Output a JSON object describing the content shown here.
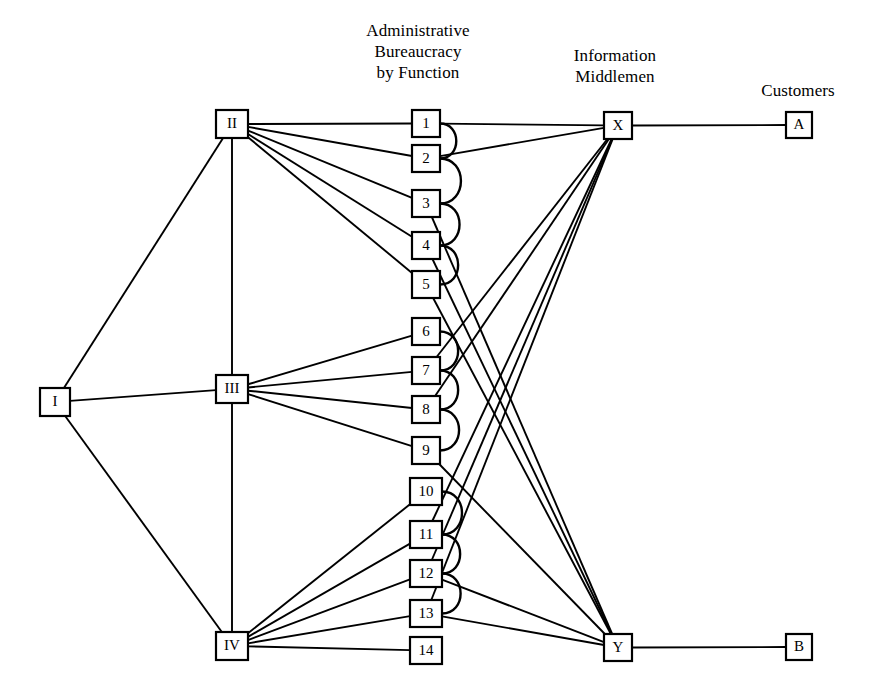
{
  "titles": {
    "admin": "Administrative\nBureaucracy\nby Function",
    "middlemen": "Information\nMiddlemen",
    "customers": "Customers"
  },
  "chart_data": {
    "type": "diagram",
    "subtype": "network-graph",
    "title": "",
    "layers": [
      {
        "name": "source",
        "nodes": [
          "I"
        ]
      },
      {
        "name": "divisions",
        "nodes": [
          "II",
          "III",
          "IV"
        ]
      },
      {
        "name": "administrative-bureaucracy-by-function",
        "nodes": [
          "1",
          "2",
          "3",
          "4",
          "5",
          "6",
          "7",
          "8",
          "9",
          "10",
          "11",
          "12",
          "13",
          "14"
        ]
      },
      {
        "name": "information-middlemen",
        "nodes": [
          "X",
          "Y"
        ]
      },
      {
        "name": "customers",
        "nodes": [
          "A",
          "B"
        ]
      }
    ],
    "nodes": [
      {
        "id": "I",
        "label": "I",
        "x": 40,
        "y": 388,
        "w": 30,
        "h": 28
      },
      {
        "id": "II",
        "label": "II",
        "x": 216,
        "y": 110,
        "w": 32,
        "h": 28
      },
      {
        "id": "III",
        "label": "III",
        "x": 216,
        "y": 375,
        "w": 32,
        "h": 28
      },
      {
        "id": "IV",
        "label": "IV",
        "x": 216,
        "y": 632,
        "w": 32,
        "h": 28
      },
      {
        "id": "1",
        "label": "1",
        "x": 412,
        "y": 110,
        "w": 28,
        "h": 27
      },
      {
        "id": "2",
        "label": "2",
        "x": 412,
        "y": 145,
        "w": 28,
        "h": 27
      },
      {
        "id": "3",
        "label": "3",
        "x": 412,
        "y": 190,
        "w": 28,
        "h": 27
      },
      {
        "id": "4",
        "label": "4",
        "x": 412,
        "y": 232,
        "w": 28,
        "h": 27
      },
      {
        "id": "5",
        "label": "5",
        "x": 412,
        "y": 271,
        "w": 28,
        "h": 27
      },
      {
        "id": "6",
        "label": "6",
        "x": 412,
        "y": 318,
        "w": 28,
        "h": 27
      },
      {
        "id": "7",
        "label": "7",
        "x": 412,
        "y": 357,
        "w": 28,
        "h": 27
      },
      {
        "id": "8",
        "label": "8",
        "x": 412,
        "y": 396,
        "w": 28,
        "h": 27
      },
      {
        "id": "9",
        "label": "9",
        "x": 412,
        "y": 437,
        "w": 28,
        "h": 27
      },
      {
        "id": "10",
        "label": "10",
        "x": 410,
        "y": 478,
        "w": 32,
        "h": 27
      },
      {
        "id": "11",
        "label": "11",
        "x": 410,
        "y": 521,
        "w": 32,
        "h": 27
      },
      {
        "id": "12",
        "label": "12",
        "x": 410,
        "y": 560,
        "w": 32,
        "h": 27
      },
      {
        "id": "13",
        "label": "13",
        "x": 410,
        "y": 600,
        "w": 32,
        "h": 27
      },
      {
        "id": "14",
        "label": "14",
        "x": 410,
        "y": 637,
        "w": 32,
        "h": 27
      },
      {
        "id": "X",
        "label": "X",
        "x": 604,
        "y": 112,
        "w": 28,
        "h": 27
      },
      {
        "id": "Y",
        "label": "Y",
        "x": 604,
        "y": 634,
        "w": 28,
        "h": 27
      },
      {
        "id": "A",
        "label": "A",
        "x": 786,
        "y": 112,
        "w": 26,
        "h": 26
      },
      {
        "id": "B",
        "label": "B",
        "x": 786,
        "y": 634,
        "w": 26,
        "h": 26
      }
    ],
    "edges": [
      {
        "from": "I",
        "to": "II"
      },
      {
        "from": "I",
        "to": "III"
      },
      {
        "from": "I",
        "to": "IV"
      },
      {
        "from": "II",
        "to": "III"
      },
      {
        "from": "III",
        "to": "IV"
      },
      {
        "from": "II",
        "to": "1"
      },
      {
        "from": "II",
        "to": "2"
      },
      {
        "from": "II",
        "to": "3"
      },
      {
        "from": "II",
        "to": "4"
      },
      {
        "from": "II",
        "to": "5"
      },
      {
        "from": "III",
        "to": "6"
      },
      {
        "from": "III",
        "to": "7"
      },
      {
        "from": "III",
        "to": "8"
      },
      {
        "from": "III",
        "to": "9"
      },
      {
        "from": "IV",
        "to": "10"
      },
      {
        "from": "IV",
        "to": "11"
      },
      {
        "from": "IV",
        "to": "12"
      },
      {
        "from": "IV",
        "to": "13"
      },
      {
        "from": "IV",
        "to": "14"
      },
      {
        "from": "1",
        "to": "X"
      },
      {
        "from": "2",
        "to": "X"
      },
      {
        "from": "7",
        "to": "X"
      },
      {
        "from": "8",
        "to": "X"
      },
      {
        "from": "11",
        "to": "X"
      },
      {
        "from": "12",
        "to": "X"
      },
      {
        "from": "13",
        "to": "X"
      },
      {
        "from": "3",
        "to": "Y"
      },
      {
        "from": "4",
        "to": "Y"
      },
      {
        "from": "5",
        "to": "Y"
      },
      {
        "from": "9",
        "to": "Y"
      },
      {
        "from": "12",
        "to": "Y"
      },
      {
        "from": "13",
        "to": "Y"
      },
      {
        "from": "X",
        "to": "A"
      },
      {
        "from": "Y",
        "to": "B"
      }
    ],
    "arcs": [
      {
        "from": "1",
        "to": "2"
      },
      {
        "from": "2",
        "to": "3"
      },
      {
        "from": "3",
        "to": "4"
      },
      {
        "from": "4",
        "to": "5"
      },
      {
        "from": "6",
        "to": "7"
      },
      {
        "from": "7",
        "to": "8"
      },
      {
        "from": "8",
        "to": "9"
      },
      {
        "from": "10",
        "to": "11"
      },
      {
        "from": "11",
        "to": "12"
      },
      {
        "from": "12",
        "to": "13"
      }
    ],
    "colors": {
      "stroke": "#000000",
      "background": "#ffffff",
      "node_fill": "#ffffff"
    }
  }
}
